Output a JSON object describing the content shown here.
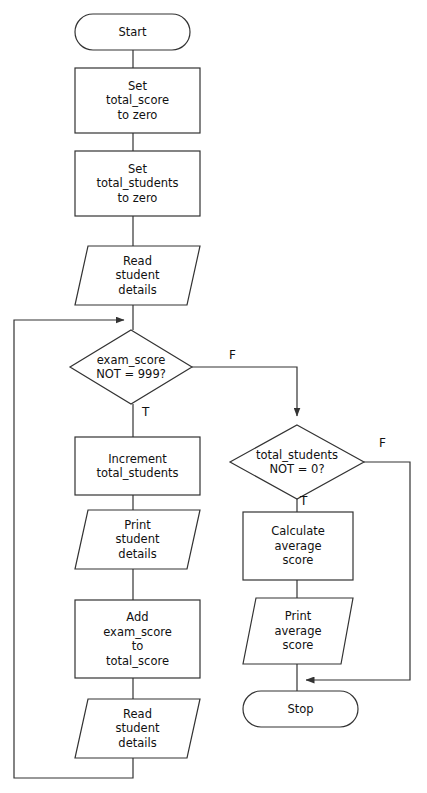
{
  "diagram": {
    "type": "flowchart",
    "background_color": "#ffffff",
    "stroke_color": "#333333",
    "text_color": "#111111"
  },
  "nodes": [
    {
      "id": "start",
      "shape": "terminator",
      "lines": [
        "Start"
      ],
      "x": 75,
      "y": 14,
      "w": 115,
      "h": 36
    },
    {
      "id": "set-total-score",
      "shape": "process",
      "lines": [
        "Set",
        "total_score",
        "to zero"
      ],
      "x": 75,
      "y": 68,
      "w": 125,
      "h": 65
    },
    {
      "id": "set-total-students",
      "shape": "process",
      "lines": [
        "Set",
        "total_students",
        "to zero"
      ],
      "x": 75,
      "y": 151,
      "w": 125,
      "h": 65
    },
    {
      "id": "read-student-details-1",
      "shape": "io",
      "lines": [
        "Read",
        "student",
        "details"
      ],
      "x": 75,
      "y": 246,
      "w": 125,
      "h": 59
    },
    {
      "id": "decision-exam-score",
      "shape": "decision",
      "lines": [
        "exam_score",
        "NOT = 999?"
      ],
      "x": 70,
      "y": 330,
      "w": 122,
      "h": 74
    },
    {
      "id": "increment-total-students",
      "shape": "process",
      "lines": [
        "Increment",
        "total_students"
      ],
      "x": 75,
      "y": 437,
      "w": 125,
      "h": 58
    },
    {
      "id": "print-student-details",
      "shape": "io",
      "lines": [
        "Print",
        "student",
        "details"
      ],
      "x": 75,
      "y": 510,
      "w": 125,
      "h": 59
    },
    {
      "id": "add-exam-score",
      "shape": "process",
      "lines": [
        "Add",
        "exam_score",
        "to",
        "total_score"
      ],
      "x": 75,
      "y": 600,
      "w": 125,
      "h": 78
    },
    {
      "id": "read-student-details-2",
      "shape": "io",
      "lines": [
        "Read",
        "student",
        "details"
      ],
      "x": 75,
      "y": 699,
      "w": 125,
      "h": 59
    },
    {
      "id": "decision-total-students",
      "shape": "decision",
      "lines": [
        "total_students",
        "NOT = 0?"
      ],
      "x": 230,
      "y": 425,
      "w": 134,
      "h": 74
    },
    {
      "id": "calculate-average-score",
      "shape": "process",
      "lines": [
        "Calculate",
        "average",
        "score"
      ],
      "x": 243,
      "y": 512,
      "w": 110,
      "h": 68
    },
    {
      "id": "print-average-score",
      "shape": "io",
      "lines": [
        "Print",
        "average",
        "score"
      ],
      "x": 243,
      "y": 598,
      "w": 110,
      "h": 66
    },
    {
      "id": "stop",
      "shape": "terminator",
      "lines": [
        "Stop"
      ],
      "x": 243,
      "y": 691,
      "w": 115,
      "h": 36
    }
  ],
  "edge_labels": [
    {
      "id": "exam-score-false",
      "text": "F",
      "x": 229,
      "y": 349
    },
    {
      "id": "exam-score-true",
      "text": "T",
      "x": 142,
      "y": 406
    },
    {
      "id": "total-students-false",
      "text": "F",
      "x": 379,
      "y": 437
    },
    {
      "id": "total-students-true",
      "text": "T",
      "x": 300,
      "y": 495
    }
  ],
  "connectors": [
    {
      "id": "start-to-set-total-score",
      "from": "start",
      "to": "set-total-score",
      "arrow": false
    },
    {
      "id": "set-total-score-to-set-total-students",
      "from": "set-total-score",
      "to": "set-total-students",
      "arrow": false
    },
    {
      "id": "set-total-students-to-read-1",
      "from": "set-total-students",
      "to": "read-student-details-1",
      "arrow": false
    },
    {
      "id": "read-1-to-decision-exam-score",
      "from": "read-student-details-1",
      "to": "decision-exam-score",
      "arrow": false
    },
    {
      "id": "decision-exam-true-to-increment",
      "from": "decision-exam-score",
      "to": "increment-total-students",
      "arrow": false
    },
    {
      "id": "increment-to-print-student",
      "from": "increment-total-students",
      "to": "print-student-details",
      "arrow": false
    },
    {
      "id": "print-student-to-add",
      "from": "print-student-details",
      "to": "add-exam-score",
      "arrow": false
    },
    {
      "id": "add-to-read-2",
      "from": "add-exam-score",
      "to": "read-student-details-2",
      "arrow": false
    },
    {
      "id": "loop-back-to-decision-exam-score",
      "from": "read-student-details-2",
      "to": "decision-exam-score",
      "arrow": true
    },
    {
      "id": "decision-exam-false-to-decision-total-students",
      "from": "decision-exam-score",
      "to": "decision-total-students",
      "arrow": true
    },
    {
      "id": "decision-total-true-to-calculate",
      "from": "decision-total-students",
      "to": "calculate-average-score",
      "arrow": false
    },
    {
      "id": "calculate-to-print-average",
      "from": "calculate-average-score",
      "to": "print-average-score",
      "arrow": false
    },
    {
      "id": "print-average-to-stop",
      "from": "print-average-score",
      "to": "stop",
      "arrow": false
    },
    {
      "id": "decision-total-false-to-stop",
      "from": "decision-total-students",
      "to": "stop",
      "arrow": true
    }
  ]
}
